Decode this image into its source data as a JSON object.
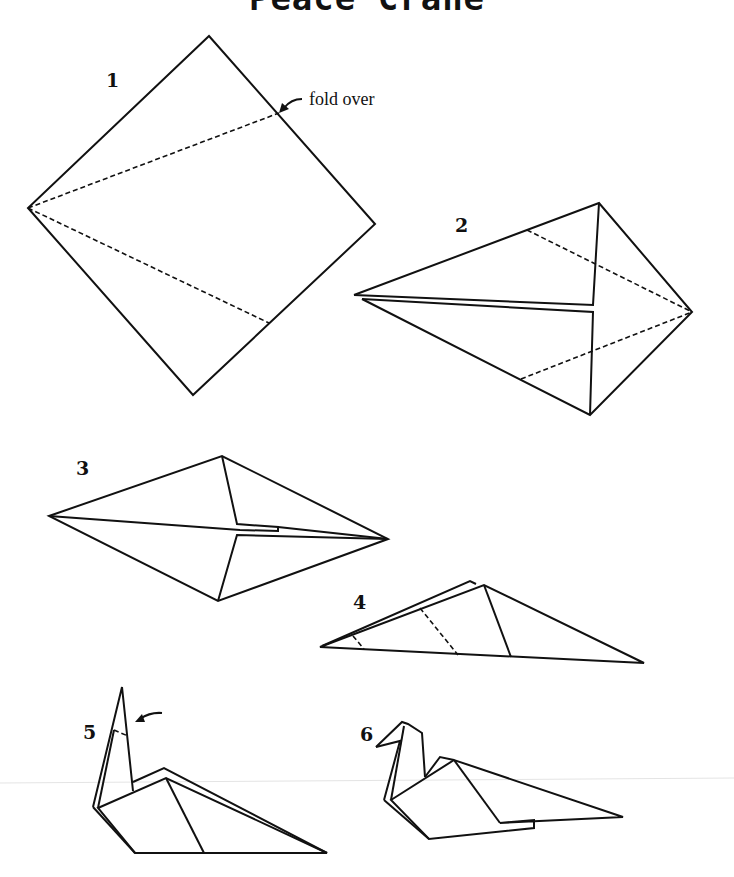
{
  "title": "Peace Crane",
  "steps": [
    {
      "number": "1",
      "annotation": "fold over",
      "description": "square paper with two dashed fold lines from left corner"
    },
    {
      "number": "2",
      "description": "kite shape with dashed fold lines toward right point"
    },
    {
      "number": "3",
      "description": "diamond shape with center flaps"
    },
    {
      "number": "4",
      "description": "folded in half with dashed fold lines"
    },
    {
      "number": "5",
      "description": "neck raised with arrow indicating head fold"
    },
    {
      "number": "6",
      "description": "finished crane with head"
    }
  ],
  "icons": {
    "fold_arrow_step1": "curved-arrow-icon",
    "fold_arrow_step5": "curved-arrow-icon"
  }
}
